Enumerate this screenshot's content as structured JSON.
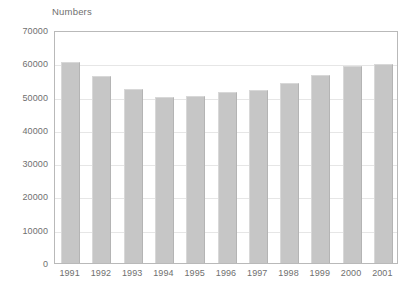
{
  "chart_data": {
    "type": "bar",
    "title": "Numbers",
    "subtitle": "",
    "xlabel": "",
    "ylabel": "Numbers",
    "categories": [
      "1991",
      "1992",
      "1993",
      "1994",
      "1995",
      "1996",
      "1997",
      "1998",
      "1999",
      "2000",
      "2001"
    ],
    "values": [
      60500,
      56300,
      52300,
      49800,
      50200,
      51300,
      52000,
      54200,
      56500,
      59200,
      59900
    ],
    "ylim": [
      0,
      70000
    ],
    "yticks": [
      0,
      10000,
      20000,
      30000,
      40000,
      50000,
      60000,
      70000
    ],
    "ytick_labels": [
      "0",
      "10000",
      "20000",
      "30000",
      "40000",
      "50000",
      "60000",
      "70000"
    ],
    "grid": true,
    "legend": false,
    "legend_position": "none",
    "bar_color": "#c6c6c6",
    "plot_border_color": "#b9b9b9",
    "grid_color": "#e6e6e6",
    "text_color": "#6f6f6f"
  }
}
